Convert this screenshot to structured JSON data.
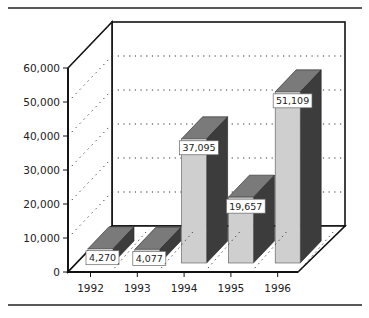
{
  "chart_data": {
    "type": "bar",
    "style": "3d-column",
    "title": "",
    "xlabel": "",
    "ylabel": "",
    "categories": [
      "1992",
      "1993",
      "1994",
      "1995",
      "1996"
    ],
    "values": [
      4270,
      4077,
      37095,
      19657,
      51109
    ],
    "data_labels": [
      "4,270",
      "4,077",
      "37,095",
      "19,657",
      "51,109"
    ],
    "ylim": [
      0,
      60000
    ],
    "y_ticks": [
      0,
      10000,
      20000,
      30000,
      40000,
      50000,
      60000
    ],
    "y_tick_labels": [
      "0",
      "10,000",
      "20,000",
      "30,000",
      "40,000",
      "50,000",
      "60,000"
    ],
    "grid": true,
    "grid_style": "dotted",
    "legend": null
  },
  "colors": {
    "bar_front": "#cfcfcf",
    "bar_top": "#7a7a7a",
    "bar_side": "#3c3c3c",
    "axis": "#111111",
    "grid": "#333333"
  }
}
